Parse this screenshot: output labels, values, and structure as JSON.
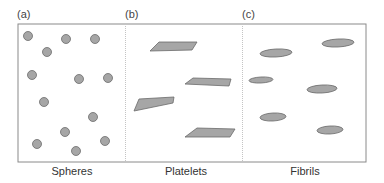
{
  "panels": [
    {
      "label": "(a)",
      "caption": "Spheres"
    },
    {
      "label": "(b)",
      "caption": "Platelets"
    },
    {
      "label": "(c)",
      "caption": "Fibrils"
    }
  ],
  "colors": {
    "fill": "#a6a6a6",
    "stroke": "#6b6b6b",
    "border": "#8a8a8a",
    "divider": "#c4c4c4"
  },
  "spheres": [
    {
      "cx": 28,
      "cy": 36
    },
    {
      "cx": 66,
      "cy": 39
    },
    {
      "cx": 95,
      "cy": 39
    },
    {
      "cx": 47,
      "cy": 52
    },
    {
      "cx": 32,
      "cy": 75
    },
    {
      "cx": 79,
      "cy": 79
    },
    {
      "cx": 108,
      "cy": 78
    },
    {
      "cx": 44,
      "cy": 102
    },
    {
      "cx": 93,
      "cy": 117
    },
    {
      "cx": 65,
      "cy": 132
    },
    {
      "cx": 37,
      "cy": 144
    },
    {
      "cx": 105,
      "cy": 141
    },
    {
      "cx": 76,
      "cy": 151
    }
  ],
  "platelets": [
    "150,51 159,42 197,42 192,50",
    "185,84 193,78 231,79 229,86",
    "134,111 139,99 174,97 173,103",
    "185,137 197,128 235,129 230,137"
  ],
  "fibrils": [
    {
      "cx": 276,
      "cy": 53,
      "rx": 16,
      "ry": 4
    },
    {
      "cx": 338,
      "cy": 43,
      "rx": 16,
      "ry": 4
    },
    {
      "cx": 261,
      "cy": 80,
      "rx": 12,
      "ry": 3
    },
    {
      "cx": 322,
      "cy": 89,
      "rx": 15,
      "ry": 4
    },
    {
      "cx": 273,
      "cy": 117,
      "rx": 13,
      "ry": 4
    },
    {
      "cx": 330,
      "cy": 130,
      "rx": 13,
      "ry": 4
    }
  ]
}
